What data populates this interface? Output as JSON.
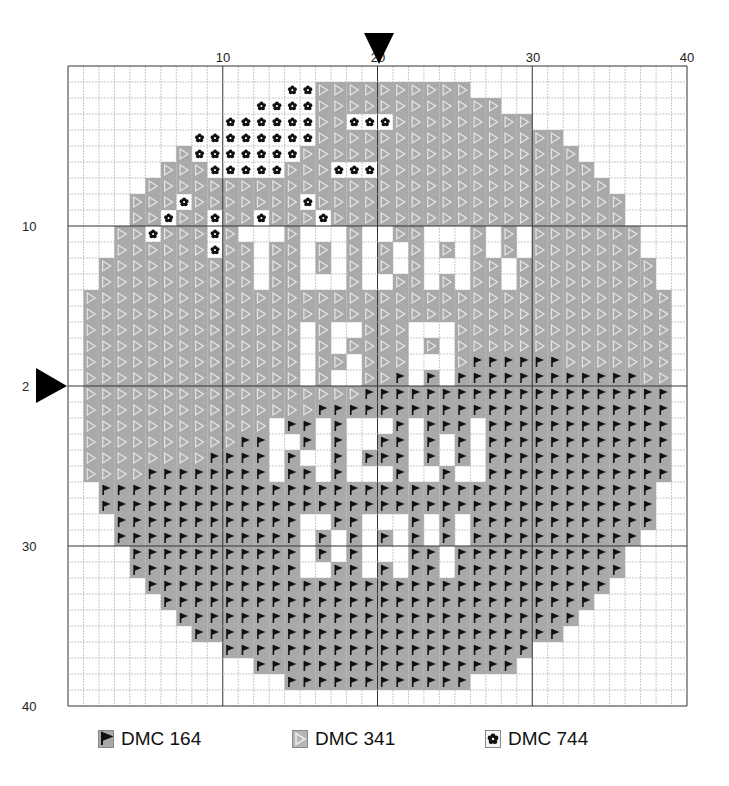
{
  "pattern": {
    "columns": 40,
    "rows": 40,
    "top_axis_labels": [
      {
        "value": "10",
        "col": 10
      },
      {
        "value": "20",
        "col": 20
      },
      {
        "value": "30",
        "col": 30
      },
      {
        "value": "40",
        "col": 40
      }
    ],
    "left_axis_labels": [
      {
        "value": "10",
        "row": 10
      },
      {
        "value": "2",
        "row": 20
      },
      {
        "value": "30",
        "row": 30
      },
      {
        "value": "40",
        "row": 40
      }
    ],
    "center_markers": {
      "col": 20,
      "row": 20
    },
    "text_in_design": [
      "TODAY",
      "IS A",
      "NEW",
      "DAY"
    ],
    "legend_key": {
      ".": "empty",
      "T": "DMC 341",
      "F": "DMC 164",
      "O": "DMC 744"
    },
    "grid_rows": [
      "........................................",
      "..............OOTTTTTTTTTT..............",
      "............OOOOTTTTTTTTTTTT............",
      "..........OOOOOOTTOOOTTTTTTTTT..........",
      "........OOOOOOOOTTTTTTTTTTTTTTTT........",
      ".......TOOOOOOOTTTTTTTTTTTTTTTTTT.......",
      "......TTTOOOOOTTTOOOTTTTTTTTTTTTTT......",
      ".....TTTTTTTTTTTTTTTTTTTTTTTTTTTTTT.....",
      "....TTTOTTTTTTTOTTTTTTTTTTTTTTTTTTTT....",
      "....TTOTTOTTOTTTOTTTTTTTTTTTTTTTTTTT....",
      "...TTOTTTOT...T...T..TT...T.T.TTTTTTT...",
      "...TTTTTTOTT.TT.T.T.T.T.T.T.T.TTTTTTT...",
      "..TTTTTTTTTT.TT.T.T.T.T...TT.TTTTTTTTT..",
      "..TTTTTTTTTT.TT...T..TT.T.TT.TTTTTTTTT..",
      ".TTTTTTTTTTTTTTTTTTTTTTTTTTTTTTTTTTTTTT.",
      ".TTTTTTTTTTTTTTTTTTTTTTTTTTTTTTTTTTTTTT.",
      ".TTTTTTTTTTTTTT.T..TTT...TTTTTTTTTTTTTT.",
      ".TTTTTTTTTTTTTT.T.TTTT.T.TTTTTTTTTTTTTT.",
      ".TTTTTTTTTTTTTT.TT.TTT...TFFFFFFTTTTTTT.",
      ".TTTTTTTTTTTTTT.T..TTF.F.FFFFFFFFFFFFTT.",
      ".TTTTTTTTTTTTTTTTTTFFFFFFFFFFFFFFFFFFFF.",
      ".TTTTTTTTTTTTTTTFFFFFFFFFFFFFFFFFFFFFFF.",
      ".TTTTTTTTTTTT.FF.F...F.FFF.FFFFFFFFFFFF.",
      ".TTTTTTTTTTFF..F.F..FF.F.F.FFFFFFFFFFFF.",
      ".TTTTTTTTFFFF.F..F.FFF.F.F.FFFFFFFFFFFF.",
      ".TTTTFFFFFFFF.FF.F...F..F..FFFFFFFFFFFF.",
      "..FFFFFFFFFFFFFFFFFFFFFFFFFFFFFFFFFFFF..",
      "..FFFFFFFFFFFFFFFFFFFFFFFFFFFFFFFFFFFF..",
      "...FFFFFFFFFFFF..FF...F.F.FFFFFFFFFFFF..",
      "...FFFFFFFFFFFF.F.F.F.F.F.FFFFFFFFFFF...",
      "....FFFFFFFFFFF.F.F...FF.FFFFFFFFFFF....",
      "....FFFFFFFFFFF..FF.F.FF.FFFFFFFFFFF....",
      ".....FFFFFFFFFFFFFFFFFFFFFFFFFFFFFF.....",
      "......FFFFFFFFFFFFFFFFFFFFFFFFFFFF......",
      ".......FFFFFFFFFFFFFFFFFFFFFFFFFF.......",
      "........FFFFFFFFFFFFFFFFFFFFFFFF........",
      "..........FFFFFFFFFFFFFFFFFFFF..........",
      "............FFFFFFFFFFFFFFFFF...........",
      "..............FFFFFFFFFFFF..............",
      "........................................"
    ]
  },
  "legend": [
    {
      "label": "DMC 164",
      "symbol": "flag-icon"
    },
    {
      "label": "DMC 341",
      "symbol": "triangle-icon"
    },
    {
      "label": "DMC 744",
      "symbol": "flower-icon"
    }
  ],
  "colors": {
    "cell_fill": "#a9a9a9",
    "triangle_stroke": "#e6e6e6",
    "flag_fill": "#111111",
    "flower_fill": "#111111",
    "grid_minor": "#b0b0b0",
    "grid_major": "#333333",
    "marker": "#000000"
  }
}
